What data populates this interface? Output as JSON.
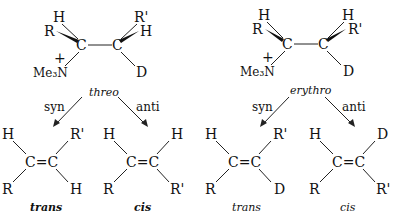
{
  "diagram": {
    "type": "E2 elimination stereochemistry",
    "panels": [
      {
        "name": "threo",
        "reactant": {
          "c1_substituents": {
            "top": "H",
            "wedge": "R",
            "bottom": "Me3N+"
          },
          "c2_substituents": {
            "top": "R'",
            "wedge": "H",
            "bottom": "D"
          },
          "c1": "C",
          "c2": "C",
          "charge": "+",
          "amine": "Me₃N"
        },
        "label": "threo",
        "pathways": [
          {
            "label": "syn",
            "product": {
              "name": "trans",
              "top_left": "H",
              "bottom_left": "R",
              "top_right": "R'",
              "bottom_right": "H",
              "double_bond": "C=C"
            }
          },
          {
            "label": "anti",
            "product": {
              "name": "cis",
              "top_left": "H",
              "bottom_left": "R",
              "top_right": "H",
              "bottom_right": "R'",
              "double_bond": "C=C"
            }
          }
        ]
      },
      {
        "name": "erythro",
        "reactant": {
          "c1_substituents": {
            "top": "H",
            "wedge": "R",
            "bottom": "Me3N+"
          },
          "c2_substituents": {
            "top": "H",
            "wedge": "R'",
            "bottom": "D"
          },
          "c1": "C",
          "c2": "C",
          "charge": "+",
          "amine": "Me₃N"
        },
        "label": "erythro",
        "pathways": [
          {
            "label": "syn",
            "product": {
              "name": "trans",
              "top_left": "H",
              "bottom_left": "R",
              "top_right": "R'",
              "bottom_right": "D",
              "double_bond": "C=C"
            }
          },
          {
            "label": "anti",
            "product": {
              "name": "cis",
              "top_left": "H",
              "bottom_left": "R",
              "top_right": "D",
              "bottom_right": "R'",
              "double_bond": "C=C"
            }
          }
        ]
      }
    ]
  }
}
